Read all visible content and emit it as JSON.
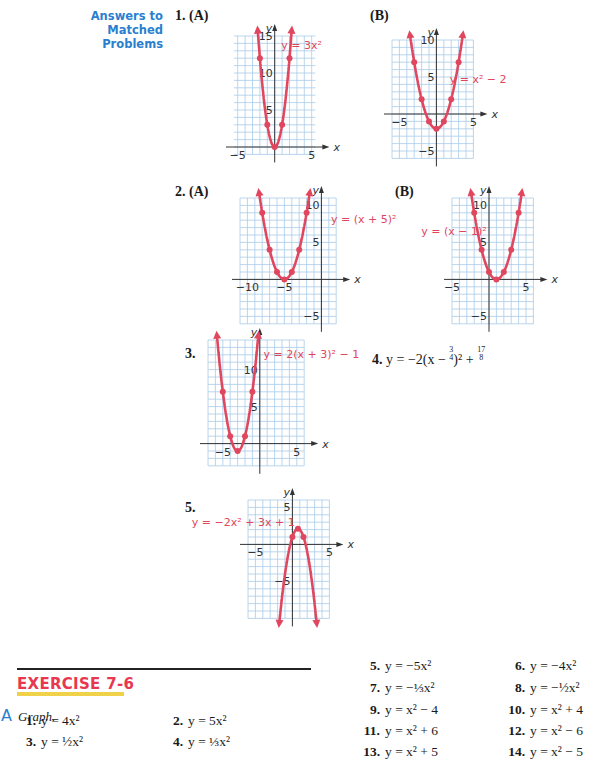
{
  "answers_section": {
    "heading_line1": "Answers to",
    "heading_line2": "Matched Problems",
    "accent_color": "#2a7fd0",
    "curve_color": "#e0475e",
    "grid_color": "#a9cbe8",
    "problems": [
      {
        "number": "1.",
        "part": "(A)",
        "equation": "y = 3x²",
        "x_ticks": [
          "−5",
          "5"
        ],
        "y_ticks": [
          "5",
          "10",
          "15"
        ],
        "x_axis": "x",
        "y_axis": "y"
      },
      {
        "number": "",
        "part": "(B)",
        "equation": "y = x² − 2",
        "x_ticks": [
          "−5",
          "5"
        ],
        "y_ticks": [
          "−5",
          "5",
          "10"
        ],
        "x_axis": "x",
        "y_axis": "y"
      },
      {
        "number": "2.",
        "part": "(A)",
        "equation": "y = (x + 5)²",
        "x_ticks": [
          "−10",
          "−5"
        ],
        "y_ticks": [
          "−5",
          "5",
          "10"
        ],
        "x_axis": "x",
        "y_axis": "y"
      },
      {
        "number": "",
        "part": "(B)",
        "equation": "y = (x − 1)²",
        "x_ticks": [
          "−5",
          "5"
        ],
        "y_ticks": [
          "−5",
          "5",
          "10"
        ],
        "x_axis": "x",
        "y_axis": "y"
      },
      {
        "number": "3.",
        "part": "",
        "equation": "y = 2(x + 3)² − 1",
        "x_ticks": [
          "−5",
          "5"
        ],
        "y_ticks": [
          "5",
          "10"
        ],
        "x_axis": "x",
        "y_axis": "y"
      },
      {
        "number": "5.",
        "part": "",
        "equation": "y = −2x² + 3x + 1",
        "x_ticks": [
          "−5",
          "5"
        ],
        "y_ticks": [
          "−5",
          "5"
        ],
        "x_axis": "x",
        "y_axis": "y"
      }
    ],
    "problem4": {
      "number": "4.",
      "lhs": "y = −2(x − ",
      "frac1_num": "3",
      "frac1_den": "4",
      "mid": ")² + ",
      "frac2_num": "17",
      "frac2_den": "8"
    }
  },
  "exercise": {
    "title": "EXERCISE 7-6",
    "title_color": "#e8384f",
    "underline_color": "#f0d24a",
    "section_letter": "A",
    "section_instruction": "Graph.",
    "problems": [
      {
        "number": "1.",
        "equation": "y = 4x²"
      },
      {
        "number": "2.",
        "equation": "y = 5x²"
      },
      {
        "number": "3.",
        "equation": "y = ½x²"
      },
      {
        "number": "4.",
        "equation": "y = ⅓x²"
      },
      {
        "number": "5.",
        "equation": "y = −5x²"
      },
      {
        "number": "6.",
        "equation": "y = −4x²"
      },
      {
        "number": "7.",
        "equation": "y = −⅓x²"
      },
      {
        "number": "8.",
        "equation": "y = −½x²"
      },
      {
        "number": "9.",
        "equation": "y = x² − 4"
      },
      {
        "number": "10.",
        "equation": "y = x² + 4"
      },
      {
        "number": "11.",
        "equation": "y = x² + 6"
      },
      {
        "number": "12.",
        "equation": "y = x² − 6"
      },
      {
        "number": "13.",
        "equation": "y = x² + 5"
      },
      {
        "number": "14.",
        "equation": "y = x² − 5"
      }
    ]
  },
  "chart_data": [
    {
      "type": "line",
      "title": "1. (A) y = 3x²",
      "a": 3,
      "h": 0,
      "k": 0,
      "points": [
        [
          -2,
          12
        ],
        [
          -1,
          3
        ],
        [
          0,
          0
        ],
        [
          1,
          3
        ],
        [
          2,
          12
        ]
      ],
      "xlim": [
        -5.5,
        5.5
      ],
      "ylim": [
        -1,
        15
      ],
      "xlabel": "x",
      "ylabel": "y",
      "grid": true
    },
    {
      "type": "line",
      "title": "1. (B) y = x² − 2",
      "a": 1,
      "h": 0,
      "k": -2,
      "points": [
        [
          -3,
          7
        ],
        [
          -2,
          2
        ],
        [
          -1,
          -1
        ],
        [
          0,
          -2
        ],
        [
          1,
          -1
        ],
        [
          2,
          2
        ],
        [
          3,
          7
        ]
      ],
      "xlim": [
        -6,
        5
      ],
      "ylim": [
        -6,
        10
      ],
      "xlabel": "x",
      "ylabel": "y",
      "grid": true
    },
    {
      "type": "line",
      "title": "2. (A) y = (x + 5)²",
      "a": 1,
      "h": -5,
      "k": 0,
      "points": [
        [
          -8,
          9
        ],
        [
          -7,
          4
        ],
        [
          -6,
          1
        ],
        [
          -5,
          0
        ],
        [
          -4,
          1
        ],
        [
          -3,
          4
        ],
        [
          -2,
          9
        ]
      ],
      "xlim": [
        -11,
        2
      ],
      "ylim": [
        -6,
        11
      ],
      "xlabel": "x",
      "ylabel": "y",
      "grid": true
    },
    {
      "type": "line",
      "title": "2. (B) y = (x − 1)²",
      "a": 1,
      "h": 1,
      "k": 0,
      "points": [
        [
          -2,
          9
        ],
        [
          -1,
          4
        ],
        [
          0,
          1
        ],
        [
          1,
          0
        ],
        [
          2,
          1
        ],
        [
          3,
          4
        ],
        [
          4,
          9
        ]
      ],
      "xlim": [
        -5,
        6
      ],
      "ylim": [
        -6,
        11
      ],
      "xlabel": "x",
      "ylabel": "y",
      "grid": true
    },
    {
      "type": "line",
      "title": "3. y = 2(x + 3)² − 1",
      "a": 2,
      "h": -3,
      "k": -1,
      "points": [
        [
          -5,
          7
        ],
        [
          -4,
          1
        ],
        [
          -3,
          -1
        ],
        [
          -2,
          1
        ],
        [
          -1,
          7
        ]
      ],
      "xlim": [
        -7,
        6
      ],
      "ylim": [
        -3,
        14
      ],
      "xlabel": "x",
      "ylabel": "y",
      "grid": true
    },
    {
      "type": "line",
      "title": "5. y = −2x² + 3x + 1",
      "a": -2,
      "h": 0.75,
      "k": 2.125,
      "points": [
        [
          0,
          1
        ],
        [
          0.75,
          2.125
        ],
        [
          1.5,
          1
        ]
      ],
      "xlim": [
        -6,
        5
      ],
      "ylim": [
        -10,
        6
      ],
      "xlabel": "x",
      "ylabel": "y",
      "grid": true
    }
  ]
}
